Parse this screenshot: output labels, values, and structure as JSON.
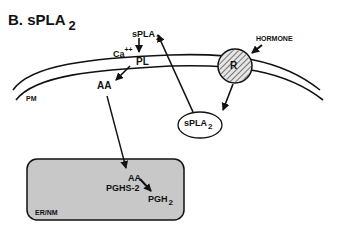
{
  "title": {
    "main": "B.  sPLA",
    "sub": "2"
  },
  "labels": {
    "ca": "Ca",
    "ca_charge": "++",
    "spla2_top": "sPLA",
    "spla2_top_sub": "2",
    "pl": "PL",
    "aa_membrane": "AA",
    "pm": "PM",
    "hormone": "HORMONE",
    "receptor": "R",
    "spla2_oval": "sPLA",
    "spla2_oval_sub": "2",
    "aa_er": "AA",
    "pghs2": "PGHS-2",
    "pgh2": "PGH",
    "pgh2_sub": "2",
    "er_nm": "ER/NM"
  },
  "colors": {
    "line": "#111111",
    "er_fill": "#c8c8c8",
    "receptor_fill": "#d8d8d8"
  }
}
